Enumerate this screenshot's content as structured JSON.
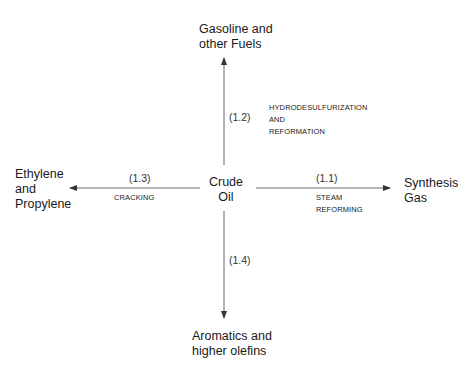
{
  "diagram": {
    "center": {
      "line1": "Crude",
      "line2": "Oil"
    },
    "top": {
      "product_line1": "Gasoline and",
      "product_line2": "other Fuels",
      "process_id": "(1.2)",
      "process_line1": "HYDRODESULFURIZATION",
      "process_line2": "AND",
      "process_line3": "REFORMATION"
    },
    "left": {
      "product_line1": "Ethylene",
      "product_line2": "and",
      "product_line3": "Propylene",
      "process_id": "(1.3)",
      "process_line1": "CRACKING"
    },
    "right": {
      "product_line1": "Synthesis",
      "product_line2": "Gas",
      "process_id": "(1.1)",
      "process_line1": "STEAM",
      "process_line2": "REFORMING"
    },
    "bottom": {
      "product_line1": "Aromatics and",
      "product_line2": "higher olefins",
      "process_id": "(1.4)"
    },
    "line_color": "#555555"
  }
}
